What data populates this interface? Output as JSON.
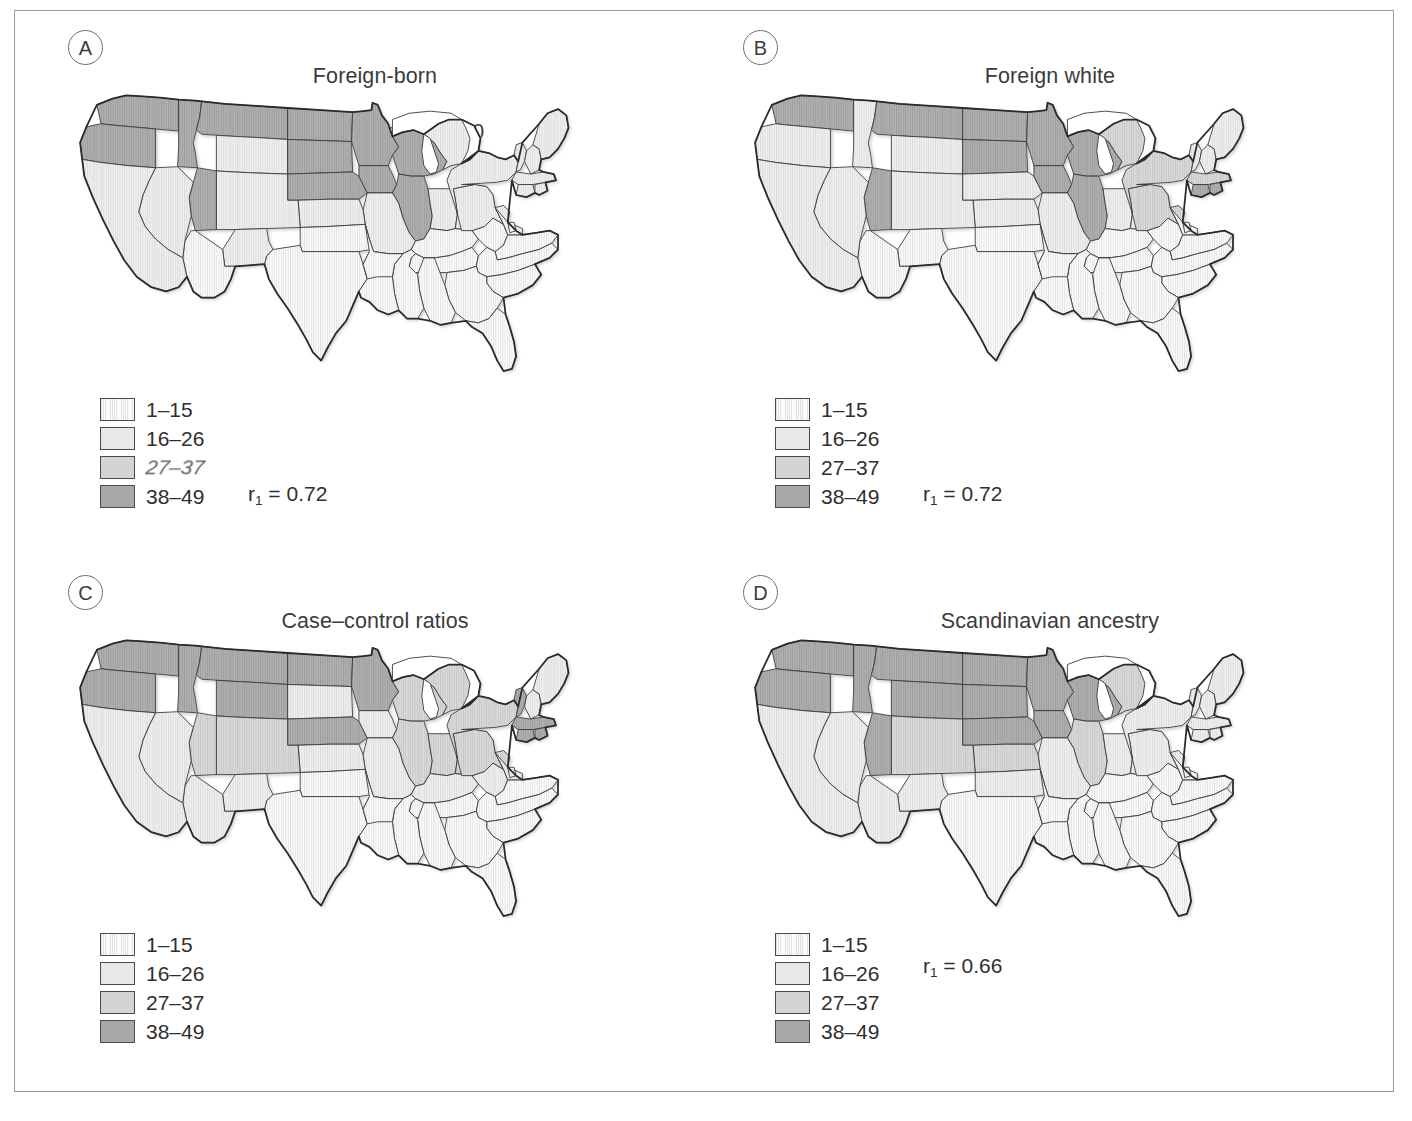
{
  "figure": {
    "kind": "four-panel choropleth map figure of the United States"
  },
  "legend_labels": [
    "1–15",
    "16–26",
    "27–37",
    "38–49"
  ],
  "legend_labels_panelA": [
    "1–15",
    "16–26",
    "27–37",
    "38–49"
  ],
  "legend_colors": [
    "#f4f4f4",
    "#e8e8e8",
    "#d4d4d4",
    "#a9a9a9"
  ],
  "panels": [
    {
      "letter": "A",
      "title_line1": "Foreign-born",
      "title_line2": "Scandinavians in 1930",
      "r_label": "r",
      "r_sub": "1",
      "r_value": " = 0.72",
      "has_r": true
    },
    {
      "letter": "B",
      "title_line1": "Foreign white",
      "title_line2": "stock in 1930",
      "r_label": "r",
      "r_sub": "1",
      "r_value": " = 0.72",
      "has_r": true
    },
    {
      "letter": "C",
      "title_line1": "Case–control ratios",
      "title_line2_pre": "(Kurtzke ",
      "title_line2_it": "et al",
      "title_line2_post": " 1979)",
      "has_r": false
    },
    {
      "letter": "D",
      "title_line1": "Scandinavian ancestry",
      "title_line2": "",
      "r_label": "r",
      "r_sub": "1",
      "r_value": " = 0.66",
      "has_r": true
    }
  ],
  "chart_data": {
    "type": "heatmap",
    "subtype": "choropleth map series (4 US state maps)",
    "bins": [
      {
        "label": "1–15",
        "range": [
          1,
          15
        ],
        "color": "#f4f4f4"
      },
      {
        "label": "16–26",
        "range": [
          16,
          26
        ],
        "color": "#e8e8e8"
      },
      {
        "label": "27–37",
        "range": [
          27,
          37
        ],
        "color": "#d4d4d4"
      },
      {
        "label": "38–49",
        "range": [
          38,
          49
        ],
        "color": "#a9a9a9"
      }
    ],
    "legend_position": "lower-left of each panel",
    "annotations": [
      {
        "panel": "A",
        "text": "r1 = 0.72"
      },
      {
        "panel": "B",
        "text": "r1 = 0.72"
      },
      {
        "panel": "D",
        "text": "r1 = 0.66"
      }
    ],
    "panels": [
      {
        "id": "A",
        "title": "Foreign-born Scandinavians in 1930",
        "correlation_r1": 0.72,
        "state_bins": {
          "WA": 4,
          "OR": 4,
          "ID": 4,
          "MT": 4,
          "WY": 2,
          "ND": 4,
          "SD": 4,
          "NE": 4,
          "MN": 4,
          "IA": 4,
          "WI": 4,
          "IL": 4,
          "UT": 4,
          "NV": 2,
          "CA": 2,
          "AZ": 1,
          "NM": 2,
          "CO": 2,
          "KS": 2,
          "OK": 1,
          "TX": 1,
          "MO": 2,
          "AR": 1,
          "LA": 1,
          "MS": 1,
          "AL": 1,
          "TN": 1,
          "KY": 1,
          "IN": 2,
          "MI": 2,
          "OH": 2,
          "WV": 1,
          "VA": 1,
          "NC": 1,
          "SC": 1,
          "GA": 1,
          "FL": 1,
          "PA": 2,
          "NY": 2,
          "NJ": 2,
          "CT": 2,
          "RI": 2,
          "MA": 2,
          "VT": 2,
          "NH": 2,
          "ME": 2,
          "MD": 1,
          "DE": 1
        }
      },
      {
        "id": "B",
        "title": "Foreign white stock in 1930",
        "correlation_r1": 0.72,
        "state_bins": {
          "WA": 4,
          "OR": 2,
          "ID": 2,
          "MT": 4,
          "WY": 2,
          "ND": 4,
          "SD": 4,
          "NE": 2,
          "MN": 4,
          "IA": 4,
          "WI": 4,
          "IL": 4,
          "UT": 4,
          "NV": 2,
          "CA": 2,
          "AZ": 1,
          "NM": 1,
          "CO": 2,
          "KS": 2,
          "OK": 1,
          "TX": 1,
          "MO": 2,
          "AR": 1,
          "LA": 1,
          "MS": 1,
          "AL": 1,
          "TN": 1,
          "KY": 1,
          "IN": 2,
          "MI": 3,
          "OH": 2,
          "WV": 1,
          "VA": 1,
          "NC": 1,
          "SC": 1,
          "GA": 1,
          "FL": 1,
          "PA": 3,
          "NY": 3,
          "NJ": 3,
          "CT": 4,
          "RI": 4,
          "MA": 3,
          "VT": 2,
          "NH": 2,
          "ME": 2,
          "MD": 1,
          "DE": 1
        }
      },
      {
        "id": "C",
        "title": "Case–control ratios (Kurtzke et al 1979)",
        "correlation_r1": null,
        "state_bins": {
          "WA": 4,
          "OR": 4,
          "ID": 4,
          "MT": 4,
          "WY": 4,
          "ND": 4,
          "SD": 2,
          "NE": 4,
          "MN": 4,
          "IA": 2,
          "WI": 3,
          "IL": 3,
          "UT": 3,
          "NV": 2,
          "CA": 2,
          "AZ": 2,
          "NM": 2,
          "CO": 3,
          "KS": 2,
          "OK": 1,
          "TX": 1,
          "MO": 2,
          "AR": 1,
          "LA": 1,
          "MS": 1,
          "AL": 1,
          "TN": 1,
          "KY": 2,
          "IN": 3,
          "MI": 3,
          "OH": 3,
          "WV": 2,
          "VA": 1,
          "NC": 1,
          "SC": 1,
          "GA": 1,
          "FL": 1,
          "PA": 3,
          "NY": 3,
          "NJ": 3,
          "CT": 4,
          "RI": 4,
          "MA": 4,
          "VT": 4,
          "NH": 2,
          "ME": 2,
          "MD": 2,
          "DE": 2
        }
      },
      {
        "id": "D",
        "title": "Scandinavian ancestry",
        "correlation_r1": 0.66,
        "state_bins": {
          "WA": 4,
          "OR": 4,
          "ID": 4,
          "MT": 4,
          "WY": 4,
          "ND": 4,
          "SD": 4,
          "NE": 4,
          "MN": 4,
          "IA": 4,
          "WI": 4,
          "IL": 3,
          "UT": 4,
          "NV": 2,
          "CA": 2,
          "AZ": 2,
          "NM": 2,
          "CO": 3,
          "KS": 3,
          "OK": 2,
          "TX": 1,
          "MO": 2,
          "AR": 1,
          "LA": 1,
          "MS": 1,
          "AL": 1,
          "TN": 1,
          "KY": 1,
          "IN": 2,
          "MI": 3,
          "OH": 2,
          "WV": 1,
          "VA": 1,
          "NC": 1,
          "SC": 1,
          "GA": 1,
          "FL": 1,
          "PA": 2,
          "NY": 2,
          "NJ": 2,
          "CT": 2,
          "RI": 2,
          "MA": 2,
          "VT": 2,
          "NH": 2,
          "ME": 2,
          "MD": 1,
          "DE": 1
        }
      }
    ]
  }
}
